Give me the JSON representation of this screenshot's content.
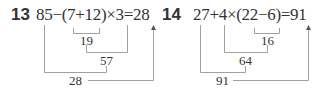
{
  "problems": [
    {
      "number": "13",
      "expression": "85−(7+12)×3=28",
      "steps": [
        "19",
        "57",
        "28"
      ]
    },
    {
      "number": "14",
      "expression": "27+4×(22−6)=91",
      "steps": [
        "16",
        "64",
        "91"
      ]
    }
  ],
  "colors": {
    "text": "#333333",
    "lines": "#999999"
  }
}
